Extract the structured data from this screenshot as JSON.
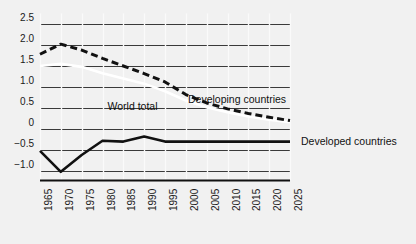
{
  "chart_data": {
    "type": "line",
    "title": "",
    "subtitle": "",
    "xlabel": "",
    "ylabel": "",
    "grid": true,
    "legend_position": "inline-annotations",
    "x": [
      1965,
      1970,
      1975,
      1980,
      1985,
      1990,
      1995,
      2000,
      2005,
      2010,
      2015,
      2020,
      2025
    ],
    "xlim": [
      1965,
      2025
    ],
    "ylim": [
      -1.25,
      2.75
    ],
    "yticks": [
      2.5,
      2.0,
      1.5,
      1.0,
      0.5,
      0,
      -0.5,
      -1.0
    ],
    "ytick_labels": [
      "2.5",
      "2.0",
      "1.5",
      "1.0",
      "0.5",
      "0",
      "−0.5",
      "−1.0"
    ],
    "xtick_labels": [
      "1965",
      "1970",
      "1975",
      "1980",
      "1985",
      "1990",
      "1995",
      "2000",
      "2005",
      "2010",
      "2015",
      "2020",
      "2025"
    ],
    "series": [
      {
        "name": "Developing countries",
        "style": "dashed",
        "color": "#111111",
        "values": [
          1.78,
          2.02,
          1.88,
          1.68,
          1.5,
          1.32,
          1.12,
          0.82,
          0.62,
          0.48,
          0.37,
          0.28,
          0.2
        ]
      },
      {
        "name": "World total",
        "style": "solid-white",
        "color": "#ffffff",
        "values": [
          1.5,
          1.55,
          1.48,
          1.33,
          1.2,
          1.08,
          0.9,
          0.68,
          0.52,
          0.4,
          0.3,
          0.22,
          0.16
        ]
      },
      {
        "name": "Developed countries",
        "style": "solid",
        "color": "#111111",
        "values": [
          -0.52,
          -1.02,
          -0.62,
          -0.28,
          -0.3,
          -0.18,
          -0.3,
          -0.3,
          -0.3,
          -0.3,
          -0.3,
          -0.3,
          -0.3
        ]
      }
    ],
    "annotations": [
      {
        "text": "World total",
        "x": 1992,
        "y": 0.55
      },
      {
        "text": "Developing countries",
        "x": 2001,
        "y": 0.72
      },
      {
        "text": "Developed countries",
        "x": 2026,
        "y": -0.28
      }
    ]
  }
}
